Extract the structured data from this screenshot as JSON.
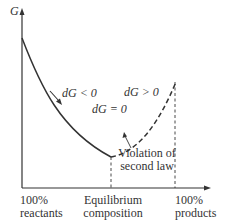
{
  "diagram": {
    "y_axis_label": "G",
    "annotations": {
      "dg_negative": "dG < 0",
      "dg_zero": "dG = 0",
      "dg_positive": "dG > 0",
      "violation_line1": "Violation of",
      "violation_line2": "second law"
    },
    "x_ticks": {
      "left_line1": "100%",
      "left_line2": "reactants",
      "middle_line1": "Equilibrium",
      "middle_line2": "composition",
      "right_line1": "100%",
      "right_line2": "products"
    },
    "colors": {
      "ink": "#333333",
      "background": "#ffffff"
    }
  }
}
